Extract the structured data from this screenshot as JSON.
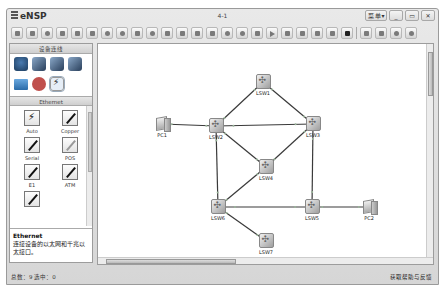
{
  "window": {
    "app_title": "eNSP",
    "doc_title": "4-1",
    "controls": {
      "menu": "菜 单▾",
      "minimize": "_",
      "maximize": "▭",
      "close": "✕"
    }
  },
  "toolbar": {
    "buttons": [
      "new-topology",
      "new-example",
      "open",
      "save",
      "save-as",
      "print",
      "undo",
      "redo",
      "select",
      "drag",
      "delete",
      "delete-all-links",
      "text-note",
      "palette",
      "zoom-in",
      "zoom-out",
      "fit",
      "start-device",
      "stop-device",
      "capture",
      "show-interface",
      "topology-labels",
      "command-line",
      "terminal",
      "forum",
      "huawei-site",
      "settings",
      "help"
    ]
  },
  "sidebar": {
    "devices_header": "设备连线",
    "devices": [
      {
        "name": "router",
        "type": "router"
      },
      {
        "name": "switch",
        "type": "switch"
      },
      {
        "name": "wlan",
        "type": "switch"
      },
      {
        "name": "firewall",
        "type": "switch"
      },
      {
        "name": "end-device",
        "type": "pc"
      },
      {
        "name": "cloud",
        "type": "cloud"
      },
      {
        "name": "connection",
        "type": "cable",
        "selected": true
      }
    ],
    "category_header": "Ethernet",
    "cables": [
      {
        "label": "Auto",
        "style": "auto"
      },
      {
        "label": "Copper",
        "style": "black"
      },
      {
        "label": "Serial",
        "style": "black"
      },
      {
        "label": "POS",
        "style": "grey"
      },
      {
        "label": "E1",
        "style": "black"
      },
      {
        "label": "ATM",
        "style": "black"
      },
      {
        "label": "",
        "style": "black"
      }
    ],
    "description": {
      "title": "Ethernet",
      "text": "连接设备的以太网和千兆以太接口。"
    }
  },
  "topology": {
    "nodes": [
      {
        "id": "LSW1",
        "label": "LSW1",
        "type": "switch",
        "x": 165,
        "y": 38
      },
      {
        "id": "LSW2",
        "label": "LSW2",
        "type": "switch",
        "x": 118,
        "y": 82
      },
      {
        "id": "LSW3",
        "label": "LSW3",
        "type": "switch",
        "x": 215,
        "y": 80
      },
      {
        "id": "LSW4",
        "label": "LSW4",
        "type": "switch",
        "x": 168,
        "y": 123
      },
      {
        "id": "LSW5",
        "label": "LSW5",
        "type": "switch",
        "x": 214,
        "y": 163
      },
      {
        "id": "LSW6",
        "label": "LSW6",
        "type": "switch",
        "x": 120,
        "y": 163
      },
      {
        "id": "LSW7",
        "label": "LSW7",
        "type": "switch",
        "x": 168,
        "y": 197
      },
      {
        "id": "PC1",
        "label": "PC1",
        "type": "pc",
        "x": 64,
        "y": 80
      },
      {
        "id": "PC2",
        "label": "PC2",
        "type": "pc",
        "x": 271,
        "y": 163
      }
    ],
    "links": [
      [
        "LSW1",
        "LSW2"
      ],
      [
        "LSW1",
        "LSW3"
      ],
      [
        "LSW2",
        "LSW3"
      ],
      [
        "PC1",
        "LSW2"
      ],
      [
        "LSW2",
        "LSW4"
      ],
      [
        "LSW3",
        "LSW4"
      ],
      [
        "LSW2",
        "LSW6"
      ],
      [
        "LSW4",
        "LSW6"
      ],
      [
        "LSW3",
        "LSW5"
      ],
      [
        "LSW6",
        "LSW5"
      ],
      [
        "LSW5",
        "PC2"
      ],
      [
        "LSW6",
        "LSW7"
      ]
    ]
  },
  "statusbar": {
    "left": "总数：9 选中：0",
    "right": "获取帮助与反馈"
  }
}
